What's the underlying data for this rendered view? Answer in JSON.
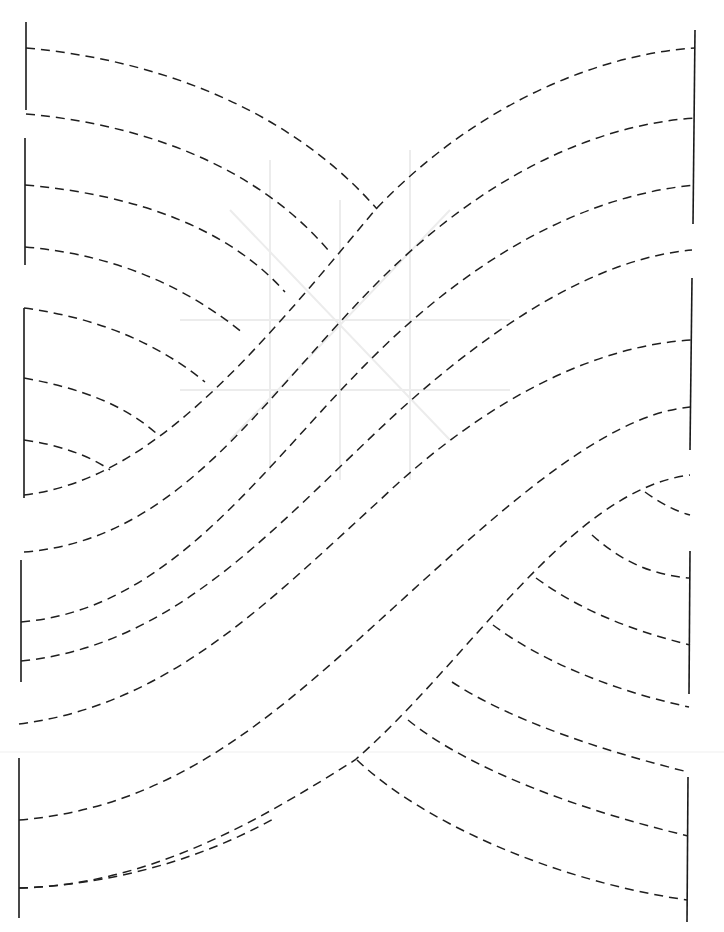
{
  "diagram": {
    "kind": "quilting-template",
    "colors": {
      "line": "#1f1f1f",
      "ghost": "#ececec",
      "background": "#ffffff"
    },
    "left_bars": [
      {
        "x1": 26,
        "y1": 22,
        "x2": 26,
        "y2": 110
      },
      {
        "x1": 25,
        "y1": 138,
        "x2": 25,
        "y2": 265
      },
      {
        "x1": 24,
        "y1": 308,
        "x2": 24,
        "y2": 498
      },
      {
        "x1": 21,
        "y1": 560,
        "x2": 21,
        "y2": 682
      },
      {
        "x1": 19,
        "y1": 758,
        "x2": 19,
        "y2": 918
      }
    ],
    "right_bars": [
      {
        "x1": 695,
        "y1": 30,
        "x2": 693,
        "y2": 224
      },
      {
        "x1": 692,
        "y1": 278,
        "x2": 690,
        "y2": 450
      },
      {
        "x1": 690,
        "y1": 551,
        "x2": 689,
        "y2": 694
      },
      {
        "x1": 688,
        "y1": 777,
        "x2": 687,
        "y2": 922
      }
    ],
    "bands": [
      "M 24 495 C 150 480, 250 360, 375 210 C 470 110, 590 55, 695 48",
      "M 24 552 C 180 540, 260 400, 380 280 C 480 180, 590 125, 695 118",
      "M 21 622 C 170 610, 260 470, 370 360 C 480 250, 590 195, 695 185",
      "M 21 661 C 180 645, 280 520, 400 410 C 500 320, 600 258, 692 250",
      "M 19 724 C 170 705, 270 600, 380 500 C 490 395, 600 345, 692 340",
      "M 19 820 C 170 808, 270 720, 380 620 C 490 520, 600 415, 690 407",
      "M 19 888 C 150 885, 260 820, 355 760 C 470 660, 570 490, 690 475",
      "M 19 888 C 110 885, 200 860, 275 818"
    ],
    "top_left_fan": [
      "M 26 48 C 160 60, 290 110, 377 209",
      "M 26 114 C 150 125, 260 170, 328 250",
      "M 25 185 C 140 195, 230 230, 285 292",
      "M 25 247 C 120 255, 190 290, 243 333",
      "M 24 308 C 100 318, 160 345, 205 382",
      "M 24 378 C 80 388, 125 405, 157 434",
      "M 24 440 C 60 445, 90 456, 110 470"
    ],
    "bottom_right_fan": [
      "M 645 492 C 660 503, 675 511, 690 515",
      "M 592 535 C 620 560, 650 575, 690 578",
      "M 536 578 C 580 610, 630 630, 690 645",
      "M 493 625 C 540 660, 610 690, 689 707",
      "M 452 682 C 510 720, 600 750, 688 772",
      "M 408 720 C 470 770, 580 810, 688 836",
      "M 357 760 C 420 820, 550 880, 687 900"
    ],
    "ghost_lines": [
      "M 270 160 L 270 470",
      "M 410 150 L 410 480",
      "M 180 320 L 510 320",
      "M 180 390 L 510 390",
      "M 340 200 L 340 480",
      "M 230 210 L 450 440",
      "M 450 210 L 230 440"
    ],
    "fold_line": {
      "x1": 0,
      "y1": 752,
      "x2": 724,
      "y2": 752
    }
  }
}
